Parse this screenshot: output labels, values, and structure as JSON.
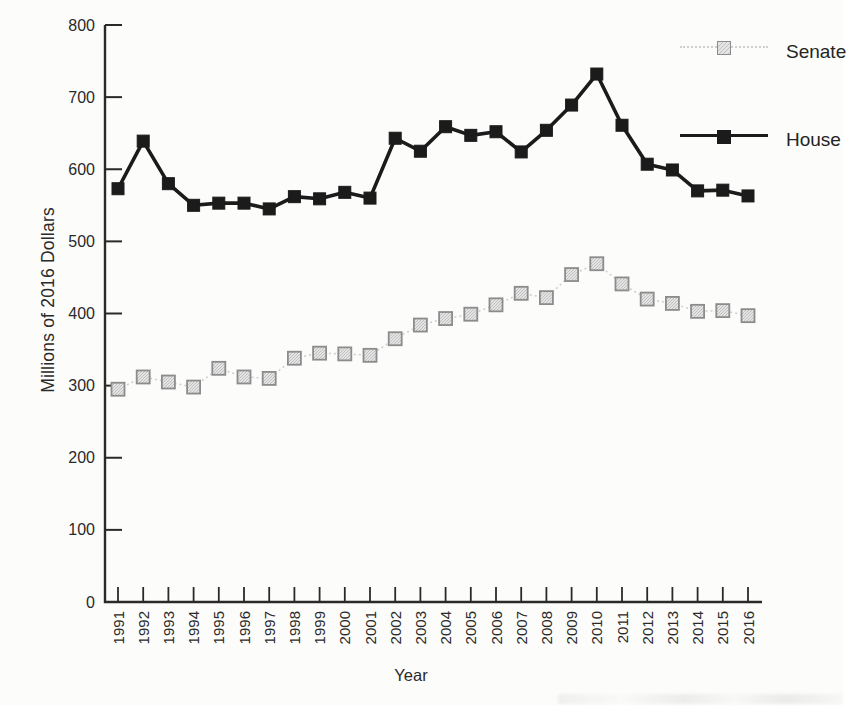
{
  "figure": {
    "background": "#fcfcfb",
    "text_color": "#2a2a2a"
  },
  "legend": {
    "position": "upper right",
    "items": [
      {
        "label": "Senate",
        "marker": "light-gray-square",
        "line": "dotted"
      },
      {
        "label": "House",
        "marker": "black-square",
        "line": "solid"
      }
    ]
  },
  "chart_data": {
    "type": "line",
    "title": "",
    "xlabel": "Year",
    "ylabel": "Millions of 2016 Dollars",
    "x": [
      1991,
      1992,
      1993,
      1994,
      1995,
      1996,
      1997,
      1998,
      1999,
      2000,
      2001,
      2002,
      2003,
      2004,
      2005,
      2006,
      2007,
      2008,
      2009,
      2010,
      2011,
      2012,
      2013,
      2014,
      2015,
      2016
    ],
    "ylim": [
      0,
      800
    ],
    "y_ticks": [
      0,
      100,
      200,
      300,
      400,
      500,
      600,
      700,
      800
    ],
    "grid": false,
    "legend_position": "upper right",
    "series": [
      {
        "name": "Senate",
        "line_style": "dotted",
        "line_color": "#cfcfcf",
        "marker": "square",
        "marker_fill": "#e4e4e4",
        "marker_hatch": "#a8a8a8",
        "marker_stroke": "#8c8c8c",
        "values": [
          295,
          312,
          305,
          298,
          324,
          312,
          310,
          338,
          345,
          344,
          342,
          365,
          384,
          393,
          399,
          412,
          428,
          422,
          454,
          469,
          441,
          420,
          414,
          403,
          404,
          397
        ]
      },
      {
        "name": "House",
        "line_style": "solid",
        "line_color": "#1b1b1b",
        "marker": "square",
        "marker_fill": "#1b1b1b",
        "marker_stroke": "#1b1b1b",
        "values": [
          573,
          639,
          580,
          550,
          553,
          553,
          545,
          562,
          559,
          568,
          560,
          643,
          625,
          659,
          647,
          652,
          624,
          654,
          689,
          732,
          661,
          607,
          599,
          570,
          571,
          563
        ]
      }
    ]
  }
}
